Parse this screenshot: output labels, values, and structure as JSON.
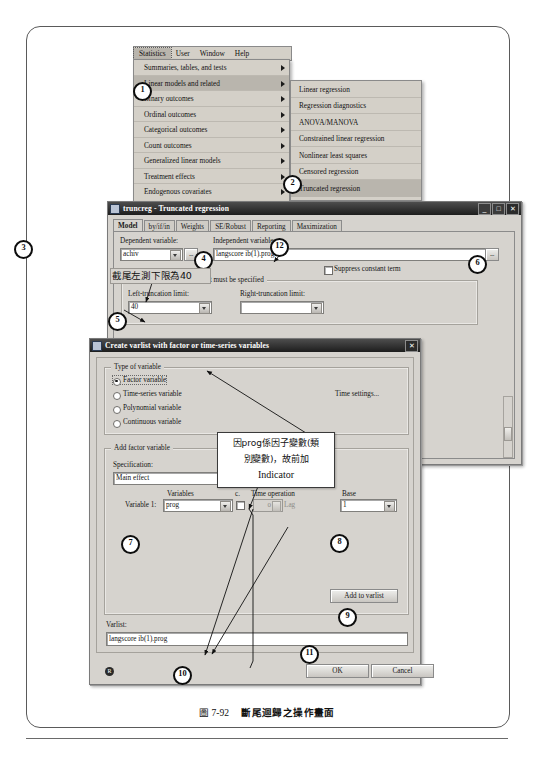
{
  "caption": {
    "figure_number": "圖 7-92",
    "title": "斷尾迴歸之操作畫面"
  },
  "menubar": {
    "items": [
      "Statistics",
      "User",
      "Window",
      "Help"
    ]
  },
  "statistics_menu": {
    "items": [
      "Summaries, tables, and tests",
      "Linear models and related",
      "Binary outcomes",
      "Ordinal outcomes",
      "Categorical outcomes",
      "Count outcomes",
      "Generalized linear models",
      "Treatment effects",
      "Endogenous covariates"
    ],
    "highlighted": "Linear models and related"
  },
  "linear_models_submenu": {
    "items": [
      "Linear regression",
      "Regression diagnostics",
      "ANOVA/MANOVA",
      "Constrained linear regression",
      "Nonlinear least squares",
      "Censored regression",
      "Truncated regression"
    ],
    "highlighted": "Truncated regression"
  },
  "truncreg_dialog": {
    "title": "truncreg - Truncated regression",
    "window_buttons": {
      "minimize": "_",
      "maximize": "□",
      "close": "✕"
    },
    "tabs": [
      {
        "label": "Model",
        "active": true
      },
      {
        "label": "by/if/in",
        "active": false
      },
      {
        "label": "Weights",
        "active": false
      },
      {
        "label": "SE/Robust",
        "active": false
      },
      {
        "label": "Reporting",
        "active": false
      },
      {
        "label": "Maximization",
        "active": false
      }
    ],
    "dependent_variable": {
      "label": "Dependent variable:",
      "value": "achiv"
    },
    "independent_variables": {
      "label": "Independent variables:",
      "value": "langscore ib(1).prog"
    },
    "browse_button": "...",
    "suppress_constant": "Suppress constant term",
    "truncation_group": "At least one truncation limit must be specified",
    "left_truncation": {
      "label": "Left-truncation limit:",
      "value": "40"
    },
    "right_truncation": {
      "label": "Right-truncation limit:",
      "value": ""
    }
  },
  "varlist_dialog": {
    "title": "Create varlist with factor or time-series variables",
    "close_button": "✕",
    "type_group": "Type of variable",
    "type_options": [
      {
        "label": "Factor variable",
        "selected": true
      },
      {
        "label": "Time-series variable",
        "selected": false
      },
      {
        "label": "Polynomial variable",
        "selected": false
      },
      {
        "label": "Continuous variable",
        "selected": false
      }
    ],
    "time_settings_button": "Time settings...",
    "add_factor_group": "Add factor variable",
    "specification": {
      "label": "Specification:",
      "value": "Main effect"
    },
    "col_headers": {
      "variables": "Variables",
      "c": "c.",
      "time_operation": "Time operation",
      "base": "Base"
    },
    "variable_row": {
      "label": "Variable 1:",
      "variable": "prog",
      "lag_value": "0",
      "lag_label": "Lag",
      "base": "1"
    },
    "add_to_varlist_button": "Add to varlist",
    "varlist": {
      "label": "Varlist:",
      "value": "langscore ib(1).prog"
    },
    "ok_button": "OK",
    "cancel_button": "Cancel",
    "help_button": "R"
  },
  "annotations": {
    "left_limit_note": "截尾左測下限為40",
    "factor_note_line1": "因prog係因子變數(類",
    "factor_note_line2": "別變數)，故前加",
    "factor_note_line3": "Indicator"
  },
  "callouts": [
    {
      "n": "1"
    },
    {
      "n": "2"
    },
    {
      "n": "3"
    },
    {
      "n": "4"
    },
    {
      "n": "5"
    },
    {
      "n": "6"
    },
    {
      "n": "7"
    },
    {
      "n": "8"
    },
    {
      "n": "9"
    },
    {
      "n": "10"
    },
    {
      "n": "11"
    },
    {
      "n": "12"
    }
  ]
}
